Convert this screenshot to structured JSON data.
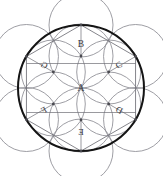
{
  "figure": {
    "title": "",
    "type": "geometric-rosette-diagram",
    "canvas": {
      "width": 163,
      "height": 176
    },
    "center": {
      "x": 81,
      "y": 88
    },
    "colors": {
      "background": "#ffffff",
      "main_circle_stroke": "#141414",
      "construction_stroke": "#8d8d93",
      "chord_stroke": "#6f6f76",
      "vertex_dot": "#4a4a50",
      "label_text": "#38383c"
    },
    "main_circle": {
      "radius": 63,
      "stroke_width": 2.0
    },
    "outer_circles": {
      "count": 6,
      "radius": 32,
      "center_radius": 63,
      "angles_deg": [
        90,
        30,
        -30,
        -90,
        -150,
        150
      ]
    },
    "inner_circles": {
      "count": 6,
      "radius": 32,
      "center_radius": 32,
      "angles_deg": [
        90,
        30,
        -30,
        -90,
        -150,
        150
      ]
    },
    "hexagon": {
      "vertex_radius": 63,
      "angles_deg": [
        90,
        30,
        -30,
        -90,
        -150,
        150
      ]
    },
    "inner_hexagon": {
      "vertex_radius": 32,
      "angles_deg": [
        90,
        30,
        -30,
        -90,
        -150,
        150
      ]
    },
    "vertex_dots": {
      "outer_radius": 63,
      "inner_radius": 32,
      "dot_radius": 1.4
    },
    "labels": [
      {
        "id": "A",
        "text": "A",
        "x": 81,
        "y": 89,
        "class": "lbl-A",
        "region": "center"
      },
      {
        "id": "B",
        "text": "B",
        "x": 81,
        "y": 45,
        "class": "lbl-B",
        "region": "top"
      },
      {
        "id": "C",
        "text": "C",
        "x": 119,
        "y": 66,
        "class": "lbl-C",
        "region": "upper-right"
      },
      {
        "id": "D",
        "text": "D",
        "x": 119,
        "y": 111,
        "class": "lbl-D",
        "region": "lower-right"
      },
      {
        "id": "E",
        "text": "E",
        "x": 81,
        "y": 133,
        "class": "lbl-E",
        "region": "bottom"
      },
      {
        "id": "F",
        "text": "F",
        "x": 44,
        "y": 111,
        "class": "lbl-F",
        "region": "lower-left"
      },
      {
        "id": "G",
        "text": "G",
        "x": 44,
        "y": 66,
        "class": "lbl-G",
        "region": "upper-left"
      }
    ]
  },
  "chart_data": {
    "type": "table",
    "title": "",
    "xlabel": "",
    "ylabel": "",
    "categories": [
      "A",
      "B",
      "C",
      "D",
      "E",
      "F",
      "G"
    ],
    "values": [
      1,
      1,
      1,
      1,
      1,
      1,
      1
    ],
    "annotations": [
      "A = central hexagonal rosette region",
      "B = top petal region",
      "C = upper-right petal region",
      "D = lower-right petal region",
      "E = bottom petal region (mirrored glyph)",
      "F = lower-left petal region (mirrored glyph)",
      "G = upper-left petal region (mirrored glyph)"
    ],
    "grid": false,
    "legend_position": "none"
  }
}
